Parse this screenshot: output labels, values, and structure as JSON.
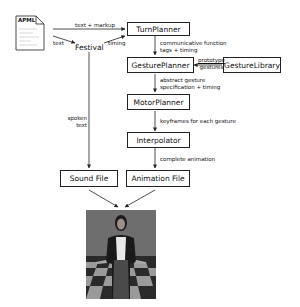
{
  "diagram": {
    "input_doc": {
      "label": "APML"
    },
    "nodes": {
      "festival": "Festival",
      "turn_planner": "TurnPlanner",
      "gesture_planner": "GesturePlanner",
      "gesture_library": "GestureLibrary",
      "motor_planner": "MotorPlanner",
      "interpolator": "Interpolator",
      "sound_file": "Sound File",
      "animation_file": "Animation File"
    },
    "edges": {
      "apml_to_turnplanner": "text + markup",
      "apml_to_festival": "text",
      "festival_to_turnplanner": "timing",
      "turnplanner_to_gestureplanner_1": "communicative function",
      "turnplanner_to_gestureplanner_2": "tags + timing",
      "library_to_planner_1": "prototype",
      "library_to_planner_2": "gestures",
      "gestureplanner_to_motor_1": "abstract gesture",
      "gestureplanner_to_motor_2": "specification + timing",
      "motor_to_interpolator": "keyframes for each gesture",
      "interpolator_to_animation": "complete animation",
      "festival_to_sound_1": "spoken",
      "festival_to_sound_2": "text"
    },
    "output": {
      "description": "rendered avatar on checkerboard floor"
    }
  }
}
